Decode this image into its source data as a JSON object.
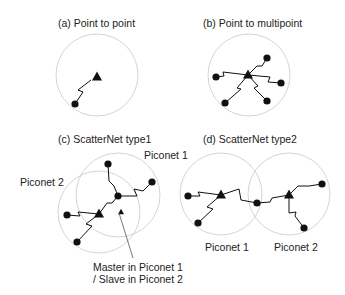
{
  "panels": {
    "a": {
      "title": "(a) Point to point",
      "circles": [
        {
          "cx": 97,
          "cy": 75,
          "r": 41
        }
      ],
      "masters": [
        {
          "x": 97,
          "y": 77
        }
      ],
      "slaves": [
        {
          "x": 75,
          "y": 104
        }
      ],
      "links": [
        "M75,104 L83,92 L78,90 L91,80"
      ]
    },
    "b": {
      "title": "(b) Point to multipoint",
      "circles": [
        {
          "cx": 249,
          "cy": 75,
          "r": 41
        }
      ],
      "masters": [
        {
          "x": 248,
          "y": 75
        }
      ],
      "slaves": [
        {
          "x": 267,
          "y": 58
        },
        {
          "x": 216,
          "y": 77
        },
        {
          "x": 281,
          "y": 83
        },
        {
          "x": 225,
          "y": 103
        },
        {
          "x": 267,
          "y": 101
        }
      ],
      "links": [
        "M248,75 L257,66 L262,66 L267,58",
        "M216,77 L224,76 L223,72 L248,75",
        "M248,75 L270,77 L268,82 L281,83",
        "M248,75 L237,88 L241,89 L225,103",
        "M248,75 L258,86 L254,88 L267,101"
      ]
    },
    "c": {
      "title": "(c) ScatterNet type1",
      "piconet1_label": "Piconet 1",
      "piconet2_label": "Piconet 2",
      "circles": [
        {
          "cx": 118,
          "cy": 195,
          "r": 42
        },
        {
          "cx": 99,
          "cy": 212,
          "r": 41
        }
      ],
      "masters": [
        {
          "x": 99,
          "y": 214
        }
      ],
      "small_masters": [
        {
          "x": 121,
          "y": 212
        }
      ],
      "slaves": [
        {
          "x": 108,
          "y": 164
        },
        {
          "x": 152,
          "y": 182
        },
        {
          "x": 118,
          "y": 196
        },
        {
          "x": 67,
          "y": 215
        },
        {
          "x": 77,
          "y": 242
        }
      ],
      "links": [
        "M108,164 L109,181 L114,186 L118,196",
        "M118,196 L137,196 L134,189 L143,191 L152,182",
        "M118,196 L112,203 L107,203 L99,214",
        "M67,215 L80,216 L78,212 L99,214",
        "M99,214 L86,224 L92,226 L77,242"
      ],
      "annotation_line1": "Master in Piconet 1",
      "annotation_line2": "/ Slave in Piconet 2",
      "arrow": {
        "x1": 133,
        "y1": 258,
        "x2": 119,
        "y2": 213
      }
    },
    "d": {
      "title": "(d) ScatterNet type2",
      "piconet1_label": "Piconet 1",
      "piconet2_label": "Piconet 2",
      "circles": [
        {
          "cx": 221,
          "cy": 194,
          "r": 41
        },
        {
          "cx": 289,
          "cy": 194,
          "r": 41
        }
      ],
      "masters": [
        {
          "x": 221,
          "y": 195
        },
        {
          "x": 289,
          "y": 195
        }
      ],
      "slaves": [
        {
          "x": 188,
          "y": 196
        },
        {
          "x": 198,
          "y": 223
        },
        {
          "x": 257,
          "y": 203
        },
        {
          "x": 322,
          "y": 184
        },
        {
          "x": 304,
          "y": 228
        }
      ],
      "links": [
        "M188,196 L200,196 L198,192 L221,195",
        "M221,195 L207,207 L213,209 L198,223",
        "M221,195 L239,189 L241,200 L257,203",
        "M257,203 L270,202 L272,198 L289,195",
        "M289,195 L298,186 L309,186 L322,184",
        "M289,195 L289,213 L296,212 L295,216 L304,228"
      ]
    }
  }
}
